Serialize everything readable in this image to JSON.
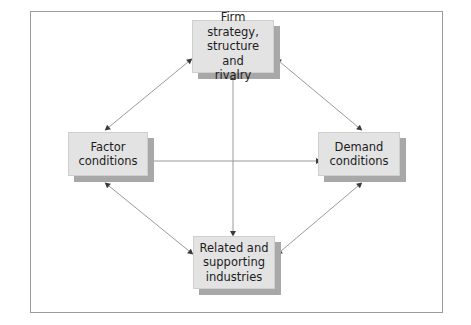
{
  "figure": {
    "caption_fragment": "",
    "frame_color": "#9a9a9a",
    "box_fill": "#e3e3e3",
    "box_border": "#cfcfcf",
    "shadow_color": "#a8a8a8",
    "arrow_color": "#8c8c8c",
    "arrowhead_color": "#333333",
    "background": "#ffffff"
  },
  "nodes": [
    {
      "id": "firm-strategy",
      "label": "Firm strategy,\nstructure and\nrivalry",
      "position": "top"
    },
    {
      "id": "factor-conditions",
      "label": "Factor\nconditions",
      "position": "left"
    },
    {
      "id": "demand-conditions",
      "label": "Demand\nconditions",
      "position": "right"
    },
    {
      "id": "related-supporting",
      "label": "Related and\nsupporting\nindustries",
      "position": "bottom"
    }
  ],
  "connectors": [
    {
      "id": "vertical-axis",
      "from": "firm-strategy",
      "to": "related-supporting",
      "style": "double-arrow",
      "orientation": "vertical"
    },
    {
      "id": "horizontal-axis",
      "from": "factor-conditions",
      "to": "demand-conditions",
      "style": "double-arrow",
      "orientation": "horizontal"
    },
    {
      "id": "top-left-diagonal",
      "from": "factor-conditions",
      "to": "firm-strategy",
      "style": "double-arrow",
      "orientation": "diagonal"
    },
    {
      "id": "top-right-diagonal",
      "from": "firm-strategy",
      "to": "demand-conditions",
      "style": "double-arrow",
      "orientation": "diagonal"
    },
    {
      "id": "bottom-left-diagonal",
      "from": "factor-conditions",
      "to": "related-supporting",
      "style": "double-arrow",
      "orientation": "diagonal"
    },
    {
      "id": "bottom-right-diagonal",
      "from": "related-supporting",
      "to": "demand-conditions",
      "style": "double-arrow",
      "orientation": "diagonal"
    }
  ]
}
